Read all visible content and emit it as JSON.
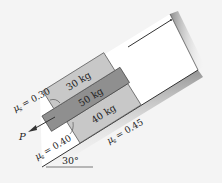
{
  "diagram": {
    "incline_angle_label": "30°",
    "blocks": [
      {
        "id": "top",
        "label": "30 kg",
        "color": "#c8c8c8"
      },
      {
        "id": "middle",
        "label": "50 kg",
        "color": "#8f8f8f"
      },
      {
        "id": "bottom",
        "label": "40 kg",
        "color": "#c8c8c8"
      }
    ],
    "friction": [
      {
        "location": "top-middle",
        "symbol": "μ",
        "subscript": "s",
        "value_text": "= 0.30"
      },
      {
        "location": "middle-bottom",
        "symbol": "μ",
        "subscript": "s",
        "value_text": "= 0.40"
      },
      {
        "location": "bottom-incline",
        "symbol": "μ",
        "subscript": "s",
        "value_text": "= 0.45"
      }
    ],
    "force": {
      "label": "P"
    },
    "colors": {
      "background": "#f4f4f4",
      "surface": "#ffffff",
      "line": "#333333",
      "wall_shade": "#9a9a9a"
    }
  }
}
